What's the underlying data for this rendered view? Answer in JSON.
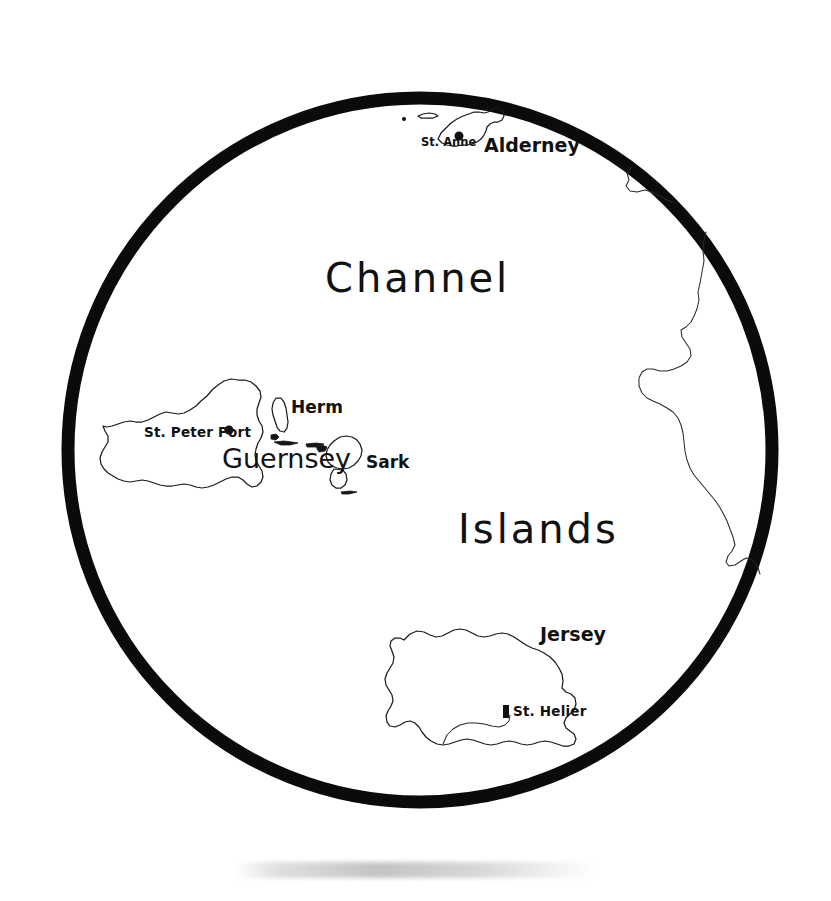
{
  "map": {
    "title": "Channel Islands",
    "frame": {
      "shape": "circle",
      "center_x": 420,
      "center_y": 450,
      "radius": 352,
      "stroke_color": "#0b0b0b",
      "stroke_width": 13
    },
    "region_labels": [
      {
        "name": "channel",
        "text": "Channel",
        "x": 325,
        "y": 292
      },
      {
        "name": "islands",
        "text": "Islands",
        "x": 458,
        "y": 543
      }
    ],
    "islands": [
      {
        "name": "alderney",
        "label": "Alderney",
        "label_x": 484,
        "label_y": 152,
        "town": {
          "label": "St. Anne",
          "x": 421,
          "y": 146,
          "dot_x": 459,
          "dot_y": 136
        }
      },
      {
        "name": "guernsey",
        "label": "Guernsey",
        "label_x": 222,
        "label_y": 468,
        "town": {
          "label": "St. Peter Port",
          "x": 144,
          "y": 437,
          "dot_x": 229,
          "dot_y": 430
        }
      },
      {
        "name": "herm",
        "label": "Herm",
        "label_x": 291,
        "label_y": 413,
        "town": null
      },
      {
        "name": "sark",
        "label": "Sark",
        "label_x": 366,
        "label_y": 468,
        "town": null
      },
      {
        "name": "jersey",
        "label": "Jersey",
        "label_x": 540,
        "label_y": 641,
        "town": {
          "label": "St. Helier",
          "x": 513,
          "y": 716,
          "dot_x": 506,
          "dot_y": 711
        }
      }
    ],
    "coastlines": [
      {
        "name": "france-normandy-coast",
        "visible": true
      },
      {
        "name": "cap-de-la-hague",
        "visible": true
      }
    ],
    "colors": {
      "background": "#ffffff",
      "ink": "#111111",
      "frame": "#0b0b0b"
    }
  }
}
